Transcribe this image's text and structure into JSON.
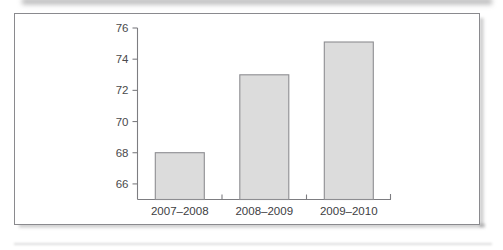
{
  "figure": {
    "background_color": "#ffffff",
    "frame_color": "#8a8a8e"
  },
  "chart_data": {
    "type": "bar",
    "title": "",
    "subtitle": "",
    "xlabel": "",
    "ylabel": "",
    "categories": [
      "2007–2008",
      "2008–2009",
      "2009–2010"
    ],
    "values": [
      68.0,
      73.0,
      75.1
    ],
    "series": [
      {
        "name": "",
        "values": [
          68.0,
          73.0,
          75.1
        ]
      }
    ],
    "ylim": [
      65.0,
      76.0
    ],
    "y_ticks": [
      66,
      68,
      70,
      72,
      74,
      76
    ],
    "y_tick_labels": [
      "66",
      "68",
      "70",
      "72",
      "74",
      "76"
    ],
    "grid": false,
    "legend": false,
    "legend_position": "none",
    "bar_fill_color": "#dcdcdc",
    "bar_edge_color": "#8d8d91",
    "axis_color": "#7d7d81",
    "annotations": []
  }
}
